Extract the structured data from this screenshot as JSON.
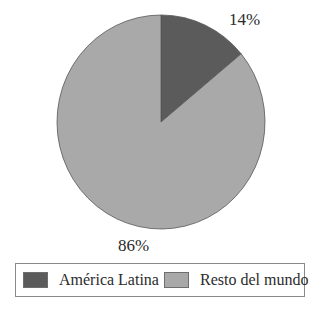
{
  "chart_data": {
    "type": "pie",
    "title": "",
    "categories": [
      "América Latina",
      "Resto del mundo"
    ],
    "values": [
      14,
      86
    ],
    "unit": "%",
    "labels": [
      "14%",
      "86%"
    ],
    "colors": [
      "#5b5b5b",
      "#a9a9a9"
    ],
    "start_angle_deg": 0,
    "direction": "clockwise",
    "legend": {
      "position": "bottom",
      "entries": [
        "América Latina",
        "Resto del mundo"
      ]
    }
  },
  "labels": {
    "latam": "14%",
    "rest": "86%"
  },
  "legend": {
    "items": [
      {
        "label": "América Latina",
        "color": "#5b5b5b"
      },
      {
        "label": "Resto del mundo",
        "color": "#a9a9a9"
      }
    ]
  }
}
